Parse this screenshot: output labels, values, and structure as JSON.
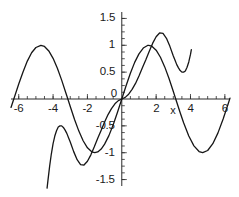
{
  "figure": {
    "width": 239,
    "height": 197,
    "background": "#ffffff",
    "curve_color": "#161616",
    "axis_color": "#2b2b2b",
    "text_color": "#1a1a1a"
  },
  "chart_data": {
    "type": "line",
    "title": "",
    "xlabel": "x",
    "ylabel": "",
    "xlim": [
      -6.45,
      6.3
    ],
    "ylim": [
      -1.62,
      1.62
    ],
    "grid": false,
    "legend": null,
    "axis_style": "centered-cross",
    "xticks": [
      -6,
      -4,
      -2,
      0,
      2,
      4,
      6
    ],
    "xticklabels": [
      "-6",
      "-4",
      "-2",
      "0",
      "2",
      "4",
      "6"
    ],
    "yticks": [
      -1.5,
      -1,
      -0.5,
      0,
      0.5,
      1,
      1.5
    ],
    "yticklabels": [
      "-1.5",
      "-1",
      "-0.5",
      "0",
      "0.5",
      "1",
      "1.5"
    ],
    "minor_tick_step_x": 0.5,
    "minor_tick_step_y": 0.125,
    "series": [
      {
        "name": "sin(x)",
        "expression": "sin(x)",
        "color": "#161616",
        "linewidth": 1.3,
        "x": [
          -6.45,
          -6.2,
          -6.0,
          -5.75,
          -5.5,
          -5.25,
          -5.0,
          -4.71,
          -4.5,
          -4.25,
          -4.0,
          -3.75,
          -3.5,
          -3.25,
          -3.14,
          -3.0,
          -2.75,
          -2.5,
          -2.25,
          -2.0,
          -1.75,
          -1.57,
          -1.4,
          -1.2,
          -1.0,
          -0.75,
          -0.5,
          -0.25,
          0,
          0.25,
          0.5,
          0.75,
          1.0,
          1.25,
          1.5,
          1.57,
          1.75,
          2.0,
          2.25,
          2.5,
          2.75,
          3.0,
          3.14,
          3.4,
          3.6,
          3.9,
          4.2,
          4.5,
          4.71,
          5.0,
          5.3,
          5.6,
          5.9,
          6.2,
          6.3
        ],
        "y": [
          -0.157,
          0.083,
          0.279,
          0.503,
          0.706,
          0.861,
          0.959,
          1.0,
          0.978,
          0.895,
          0.757,
          0.572,
          0.351,
          0.108,
          0.0,
          -0.141,
          -0.382,
          -0.598,
          -0.778,
          -0.909,
          -0.984,
          -1.0,
          -0.985,
          -0.932,
          -0.841,
          -0.682,
          -0.479,
          -0.247,
          0.0,
          0.247,
          0.479,
          0.682,
          0.841,
          0.949,
          0.997,
          1.0,
          0.984,
          0.909,
          0.778,
          0.598,
          0.382,
          0.141,
          0.0,
          -0.256,
          -0.443,
          -0.688,
          -0.872,
          -0.978,
          -1.0,
          -0.959,
          -0.832,
          -0.631,
          -0.373,
          -0.083,
          0.017
        ]
      },
      {
        "name": "x - x^3/6 + x^5/120",
        "expression": "x - x^3/6 + x^5/120",
        "color": "#161616",
        "linewidth": 1.3,
        "x": [
          -4.35,
          -4.3,
          -4.2,
          -4.1,
          -4.0,
          -3.9,
          -3.8,
          -3.7,
          -3.6,
          -3.5,
          -3.4,
          -3.3,
          -3.2,
          -3.1,
          -3.0,
          -2.8,
          -2.6,
          -2.4,
          -2.2,
          -2.0,
          -1.8,
          -1.6,
          -1.4,
          -1.2,
          -1.0,
          -0.8,
          -0.6,
          -0.4,
          -0.2,
          0,
          0.2,
          0.4,
          0.6,
          0.8,
          1.0,
          1.2,
          1.4,
          1.6,
          1.8,
          2.0,
          2.2,
          2.4,
          2.6,
          2.8,
          3.0,
          3.1,
          3.2,
          3.3,
          3.4,
          3.5,
          3.6,
          3.7,
          3.8,
          3.9,
          4.0,
          4.05
        ],
        "y": [
          -1.66,
          -1.52,
          -1.25,
          -1.02,
          -0.83,
          -0.69,
          -0.59,
          -0.52,
          -0.5,
          -0.5,
          -0.53,
          -0.58,
          -0.64,
          -0.72,
          -0.8,
          -0.98,
          -1.13,
          -1.22,
          -1.23,
          -1.16,
          -1.04,
          -0.89,
          -0.73,
          -0.58,
          -0.43,
          -0.29,
          -0.18,
          -0.09,
          -0.03,
          0.0,
          0.03,
          0.09,
          0.18,
          0.29,
          0.43,
          0.58,
          0.73,
          0.89,
          1.04,
          1.16,
          1.23,
          1.22,
          1.13,
          0.98,
          0.8,
          0.72,
          0.64,
          0.58,
          0.53,
          0.5,
          0.5,
          0.52,
          0.59,
          0.69,
          0.83,
          0.92
        ]
      }
    ]
  },
  "labels": {
    "x_axis_name": "x",
    "x_tick_minus6": "-6",
    "x_tick_minus4": "-4",
    "x_tick_minus2": "-2",
    "x_tick_0": "0",
    "x_tick_2": "2",
    "x_tick_4": "4",
    "x_tick_6": "6",
    "y_tick_1p5": "1.5",
    "y_tick_1": "1",
    "y_tick_0p5": "0.5",
    "y_tick_minus0p5": "-0.5",
    "y_tick_minus1": "-1",
    "y_tick_minus1p5": "-1.5"
  }
}
